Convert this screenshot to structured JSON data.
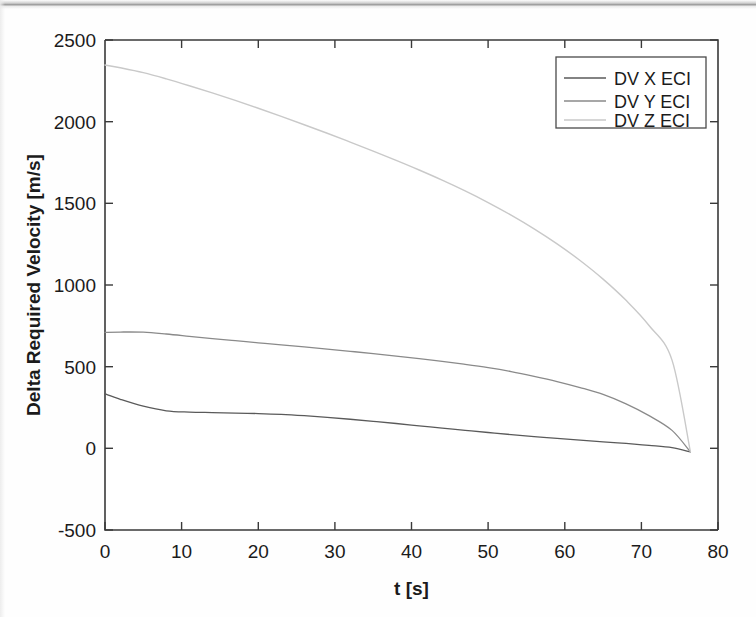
{
  "chart_data": {
    "type": "line",
    "title": "",
    "xlabel": "t [s]",
    "ylabel": "Delta Required Velocity [m/s]",
    "xlim": [
      0,
      80
    ],
    "ylim": [
      -500,
      2500
    ],
    "xticks": [
      "0",
      "10",
      "20",
      "30",
      "40",
      "50",
      "60",
      "70",
      "80"
    ],
    "yticks": [
      "-500",
      "0",
      "500",
      "1000",
      "1500",
      "2000",
      "2500"
    ],
    "xtick_values": [
      0,
      10,
      20,
      30,
      40,
      50,
      60,
      70,
      80
    ],
    "ytick_values": [
      -500,
      0,
      500,
      1000,
      1500,
      2000,
      2500
    ],
    "grid": false,
    "legend_position": "top-right",
    "x": [
      0,
      2,
      5,
      8,
      11,
      14,
      17,
      20,
      23,
      26,
      29,
      32,
      35,
      38,
      41,
      44,
      47,
      50,
      53,
      56,
      59,
      62,
      65,
      68,
      71,
      74,
      76.4
    ],
    "series": [
      {
        "name": "DV X ECI",
        "color": "#5a5a5a",
        "linewidth": 1.3,
        "values": [
          333,
          300,
          258,
          230,
          222,
          219,
          216,
          213,
          208,
          200,
          190,
          178,
          165,
          152,
          138,
          124,
          110,
          97,
          84,
          72,
          61,
          50,
          40,
          30,
          18,
          4,
          -22
        ]
      },
      {
        "name": "DV Y ECI",
        "color": "#8a8a8a",
        "linewidth": 1.3,
        "values": [
          710,
          712,
          711,
          700,
          686,
          672,
          659,
          646,
          634,
          621,
          608,
          594,
          580,
          565,
          549,
          532,
          514,
          494,
          470,
          441,
          409,
          372,
          330,
          272,
          200,
          110,
          -22
        ]
      },
      {
        "name": "DV Z ECI",
        "color": "#c9c9c9",
        "linewidth": 1.4,
        "values": [
          2347,
          2330,
          2300,
          2262,
          2220,
          2176,
          2130,
          2082,
          2032,
          1981,
          1929,
          1875,
          1820,
          1763,
          1704,
          1642,
          1576,
          1505,
          1428,
          1344,
          1252,
          1150,
          1036,
          906,
          752,
          540,
          -22
        ]
      }
    ]
  },
  "legend": {
    "entries": [
      {
        "label": "DV X ECI"
      },
      {
        "label": "DV Y ECI"
      },
      {
        "label": "DV Z ECI"
      }
    ]
  },
  "axes": {
    "x_title": "t [s]",
    "y_title": "Delta Required Velocity [m/s]"
  }
}
